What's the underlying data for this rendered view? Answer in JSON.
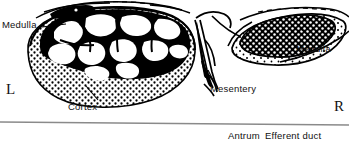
{
  "figure": {
    "background_color": "#ffffff",
    "ink_color": "#000000",
    "rule_color": "#8a8a8a"
  },
  "labels": {
    "medulla_left": "Medulla",
    "medulla_right": "Medulla",
    "cortex": "Cortex",
    "mesentery": "Mesentery",
    "side_left": "L",
    "side_right": "R"
  },
  "caption": {
    "antrum": "Antrum",
    "efferent_duct": "Efferent duct"
  }
}
